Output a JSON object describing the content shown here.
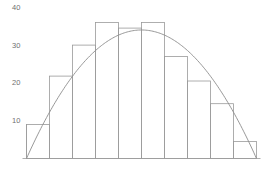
{
  "chart_data": {
    "type": "bar",
    "title": "",
    "subtitle": "",
    "xlabel": "",
    "ylabel": "",
    "categories": [
      "1",
      "2",
      "3",
      "4",
      "5",
      "6",
      "7",
      "8",
      "9",
      "10"
    ],
    "values": [
      9,
      21.8,
      30,
      36,
      34.5,
      36,
      27,
      20.5,
      14.5,
      4.5
    ],
    "series": [
      {
        "name": "histogram",
        "type": "bar",
        "values": [
          9,
          21.8,
          30,
          36,
          34.5,
          36,
          27,
          20.5,
          14.5,
          4.5
        ]
      },
      {
        "name": "fitted-curve",
        "type": "line",
        "description": "parabolic curve from origin rising to apex ~34 and returning to zero",
        "x": [
          0,
          1,
          2,
          3,
          4,
          5,
          6,
          7,
          8,
          9,
          10
        ],
        "values": [
          0,
          12.2,
          21.8,
          28.6,
          32.8,
          34.0,
          32.8,
          28.6,
          21.8,
          12.2,
          0
        ]
      }
    ],
    "ylim": [
      0,
      40
    ],
    "yticks": [
      10,
      20,
      30,
      40
    ],
    "ytick_labels": [
      "10",
      "20",
      "30",
      "40"
    ],
    "xticks": [],
    "xtick_labels": [],
    "grid": false,
    "legend": false,
    "legend_position": "none",
    "bar_fill": "none",
    "bar_stroke": "#9a9a9a",
    "curve_stroke": "#8d8d8d",
    "axis_stroke": "#9a9a9a",
    "tick_label_color": "#6f6f6f",
    "background": "#ffffff"
  },
  "axis": {
    "y_labels": [
      "40",
      "30",
      "20",
      "10"
    ]
  }
}
